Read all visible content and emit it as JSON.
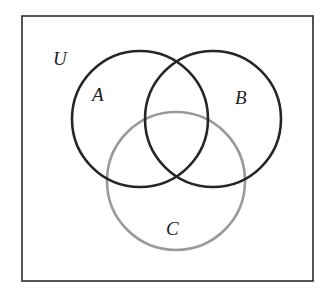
{
  "diagram": {
    "type": "venn",
    "universe": {
      "label": "U",
      "x": 22,
      "y": 16,
      "width": 291,
      "height": 265,
      "stroke": "#2a2a2a"
    },
    "sets": [
      {
        "label": "A",
        "cx": 140,
        "cy": 119,
        "r": 68,
        "stroke": "#262626",
        "label_x": 92,
        "label_y": 101
      },
      {
        "label": "B",
        "cx": 213,
        "cy": 119,
        "r": 68,
        "stroke": "#262626",
        "label_x": 235,
        "label_y": 104
      },
      {
        "label": "C",
        "cx": 176,
        "cy": 181,
        "r": 69,
        "stroke": "#9a9a9a",
        "label_x": 166,
        "label_y": 235
      }
    ],
    "universe_label_pos": {
      "x": 53,
      "y": 65
    }
  }
}
